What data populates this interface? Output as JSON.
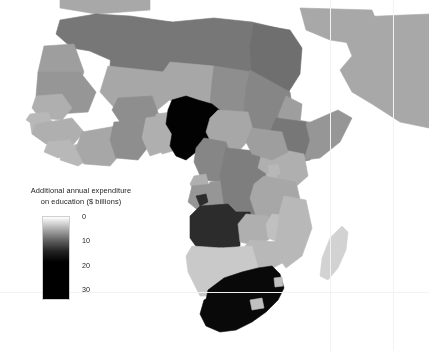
{
  "figure": {
    "width": 429,
    "height": 351,
    "background_color": "#ffffff",
    "type": "choropleth-map",
    "region": "Africa"
  },
  "legend": {
    "title_line1": "Additional annual expenditure",
    "title_line2": "on education ($ billions)",
    "title": "Additional annual expenditure\non education ($ billions)",
    "ticks": [
      {
        "label": "0",
        "value": 0
      },
      {
        "label": "10",
        "value": 10
      },
      {
        "label": "20",
        "value": 20
      },
      {
        "label": "30",
        "value": 30
      }
    ],
    "colorbar": {
      "orientation": "vertical",
      "low_color": "#ffffff",
      "high_color": "#000000",
      "min_value": -3,
      "max_value": 34
    }
  },
  "chart_data": {
    "type": "heatmap",
    "title": "Additional annual expenditure on education ($ billions)",
    "xlabel": "",
    "ylabel": "",
    "colorscale": "grayscale-reversed",
    "value_range": [
      0,
      30
    ],
    "unit": "$ billions",
    "grid": true,
    "legend_position": "left",
    "categories": [
      "Nigeria",
      "South Africa",
      "Angola",
      "Egypt",
      "Algeria",
      "Libya",
      "Morocco",
      "Tunisia",
      "Sudan",
      "Chad",
      "Ethiopia",
      "Somalia",
      "Kenya",
      "Tanzania",
      "DR Congo",
      "Niger",
      "Mali",
      "Mauritania",
      "Cameroon",
      "Ghana",
      "Burkina Faso",
      "Ivory Coast",
      "Senegal",
      "Guinea",
      "Mozambique",
      "Zimbabwe",
      "Zambia",
      "Namibia",
      "Botswana",
      "Madagascar",
      "Uganda",
      "South Sudan",
      "Central African Republic",
      "Western Sahara",
      "Congo",
      "Gabon",
      "Benin",
      "Togo",
      "Liberia",
      "Sierra Leone",
      "Malawi",
      "Lesotho",
      "Eswatini",
      "Eritrea",
      "Djibouti",
      "Gambia",
      "Guinea-Bissau",
      "Equatorial Guinea",
      "Rwanda",
      "Burundi"
    ],
    "values": [
      33,
      31,
      24,
      14,
      13,
      13,
      13,
      12,
      11,
      10,
      13,
      9,
      6,
      7,
      12,
      7,
      7,
      9,
      11,
      10,
      10,
      7,
      6,
      6,
      5,
      5,
      6,
      3,
      3,
      2,
      6,
      8,
      7,
      8,
      9,
      9,
      6,
      6,
      5,
      5,
      4,
      4,
      4,
      8,
      7,
      5,
      5,
      6,
      5,
      5
    ],
    "highlighted": [
      {
        "name": "Nigeria",
        "value": 33,
        "shade": "black"
      },
      {
        "name": "South Africa",
        "value": 31,
        "shade": "black"
      },
      {
        "name": "Angola",
        "value": 24,
        "shade": "dark-gray"
      }
    ]
  },
  "map_features": {
    "ocean_color": "#ffffff",
    "gridline_color": "#f2f2f4",
    "out_of_scope_color": "#a8a8a8",
    "enclaves": [
      "Lesotho",
      "Eswatini"
    ],
    "islands": [
      "Madagascar"
    ]
  }
}
